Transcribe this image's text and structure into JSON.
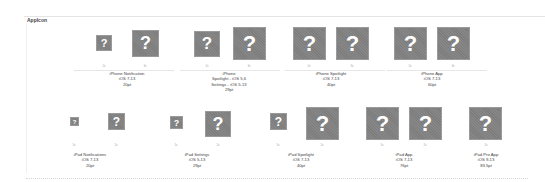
{
  "section": {
    "title": "AppIcon"
  },
  "icon_glyph": "?",
  "rows": [
    {
      "groups": [
        {
          "name": "iPhone Notification",
          "line2": "iOS 7-13",
          "line3": "20pt",
          "slots": [
            "2x",
            "3x"
          ]
        },
        {
          "name": "iPhone",
          "line2": "Spotlight - iOS 5,6",
          "line3": "Settings - iOS 5-13",
          "line4": "29pt",
          "slots": [
            "2x",
            "3x"
          ]
        },
        {
          "name": "iPhone Spotlight",
          "line2": "iOS 7-13",
          "line3": "40pt",
          "slots": [
            "2x",
            "3x"
          ]
        },
        {
          "name": "iPhone App",
          "line2": "iOS 7-13",
          "line3": "60pt",
          "slots": [
            "2x",
            "3x"
          ]
        }
      ]
    },
    {
      "groups": [
        {
          "name": "iPad Notifications",
          "line2": "iOS 7-13",
          "line3": "20pt",
          "slots": [
            "1x",
            "2x"
          ]
        },
        {
          "name": "iPad Settings",
          "line2": "iOS 5-13",
          "line3": "29pt",
          "slots": [
            "1x",
            "2x"
          ]
        },
        {
          "name": "iPad Spotlight",
          "line2": "iOS 7-13",
          "line3": "40pt",
          "slots": [
            "1x",
            "2x"
          ]
        },
        {
          "name": "iPad App",
          "line2": "iOS 7-13",
          "line3": "76pt",
          "slots": [
            "1x",
            "2x"
          ]
        },
        {
          "name": "iPad Pro App",
          "line2": "iOS 9-13",
          "line3": "83.5pt",
          "slots": [
            "2x"
          ]
        }
      ]
    }
  ]
}
